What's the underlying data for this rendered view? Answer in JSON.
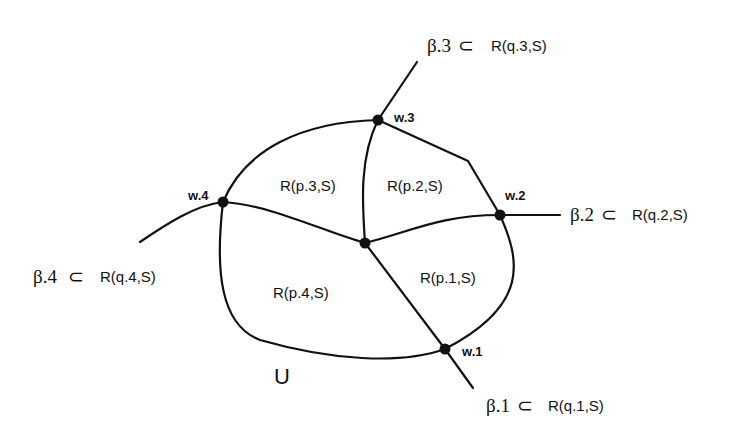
{
  "diagram": {
    "domain_label": "U",
    "regions": [
      {
        "id": "p1",
        "label": "R(p.1,S)"
      },
      {
        "id": "p2",
        "label": "R(p.2,S)"
      },
      {
        "id": "p3",
        "label": "R(p.3,S)"
      },
      {
        "id": "p4",
        "label": "R(p.4,S)"
      }
    ],
    "boundary_points": [
      {
        "id": "w1",
        "label": "w.1"
      },
      {
        "id": "w2",
        "label": "w.2"
      },
      {
        "id": "w3",
        "label": "w.3"
      },
      {
        "id": "w4",
        "label": "w.4"
      }
    ],
    "rays": [
      {
        "id": "b1",
        "beta": "β.1",
        "subset": "⊂",
        "target": "R(q.1,S)"
      },
      {
        "id": "b2",
        "beta": "β.2",
        "subset": "⊂",
        "target": "R(q.2,S)"
      },
      {
        "id": "b3",
        "beta": "β.3",
        "subset": "⊂",
        "target": "R(q.3,S)"
      },
      {
        "id": "b4",
        "beta": "β.4",
        "subset": "⊂",
        "target": "R(q.4,S)"
      }
    ],
    "colors": {
      "stroke": "#111111",
      "background": "#ffffff"
    }
  }
}
